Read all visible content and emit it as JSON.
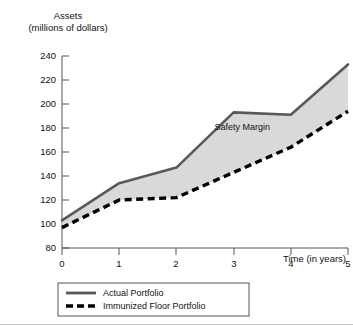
{
  "chart_data": {
    "type": "area",
    "title": "Assets (millions of dollars)",
    "title_line1": "Assets",
    "title_line2": "(millions of dollars)",
    "xlabel": "Time (in years)",
    "ylabel": "Assets (millions of dollars)",
    "x": [
      0,
      1,
      2,
      3,
      4,
      5
    ],
    "xticklabels": [
      "0",
      "1",
      "2",
      "3",
      "4",
      "5"
    ],
    "yticklabels": [
      "80",
      "100",
      "120",
      "140",
      "160",
      "180",
      "200",
      "220",
      "240"
    ],
    "yticks": [
      80,
      100,
      120,
      140,
      160,
      180,
      200,
      220,
      240
    ],
    "xlim": [
      0,
      5
    ],
    "ylim": [
      80,
      240
    ],
    "grid": false,
    "legend_position": "below-axis-left",
    "series": [
      {
        "name": "Actual Portfolio",
        "style": "solid",
        "color": "#595959",
        "values": [
          103,
          134,
          147,
          193,
          191,
          233
        ]
      },
      {
        "name": "Immunized Floor Portfolio",
        "style": "dashed",
        "color": "#000000",
        "values": [
          97,
          120,
          122,
          143,
          164,
          194
        ]
      }
    ],
    "fill_between": {
      "label": "Safety Margin",
      "color": "#d9d9d9",
      "upper_series": "Actual Portfolio",
      "lower_series": "Immunized Floor Portfolio"
    },
    "annotations": [
      {
        "text": "Safety Margin",
        "x": 3.15,
        "y": 178
      }
    ]
  },
  "legend": {
    "items": [
      {
        "label": "Actual Portfolio",
        "style": "solid"
      },
      {
        "label": "Immunized Floor Portfolio",
        "style": "dashed"
      }
    ]
  },
  "colors": {
    "actual_line": "#595959",
    "floor_line": "#000000",
    "safety_margin_fill": "#d9d9d9",
    "axis": "#555555",
    "text": "#111111"
  }
}
